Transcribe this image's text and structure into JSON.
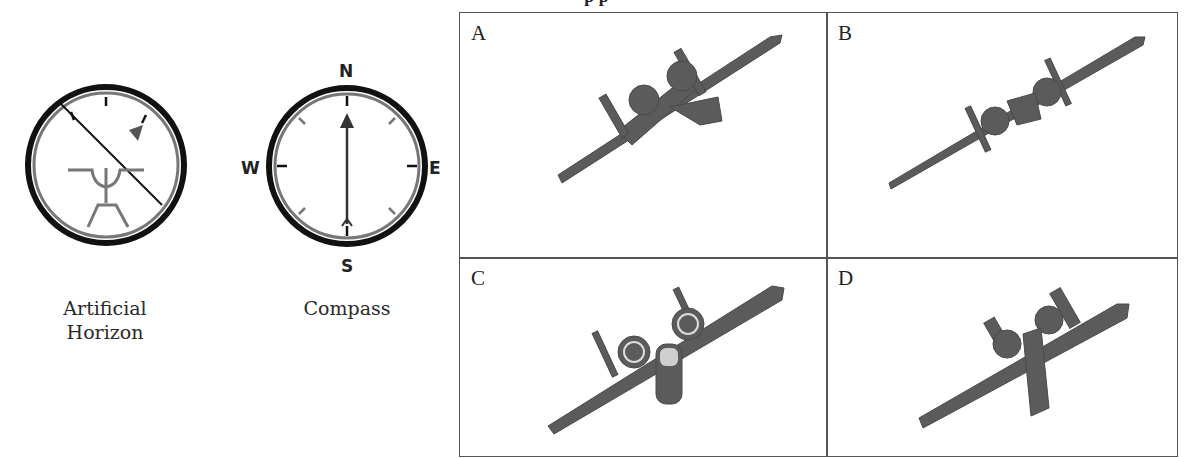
{
  "figure": {
    "title_fragment": "p                                             p",
    "instruments": [
      {
        "id": "artificial-horizon",
        "label_line1": "Artificial",
        "label_line2": "Horizon",
        "bank_line_angle_deg": -45,
        "bank_pointer": "triangle-upper-right"
      },
      {
        "id": "compass",
        "label_line1": "Compass",
        "cardinals": {
          "n": "N",
          "e": "E",
          "s": "S",
          "w": "W"
        },
        "heading": "N"
      }
    ],
    "options": [
      {
        "letter": "A",
        "description": "aircraft banking left, rear view"
      },
      {
        "letter": "B",
        "description": "aircraft banking left, rear-top view"
      },
      {
        "letter": "C",
        "description": "aircraft banking left, rear-underside view"
      },
      {
        "letter": "D",
        "description": "aircraft banking left, underside view"
      }
    ]
  },
  "colors": {
    "ring_outer": "#111111",
    "ring_inner": "#777777",
    "aircraft": "#5b5b5b",
    "grid_line": "#555555"
  }
}
